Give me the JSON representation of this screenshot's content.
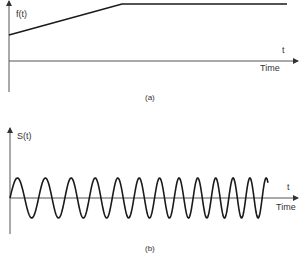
{
  "panel_a": {
    "ylabel": "f(t)",
    "xlabel_symbol": "t",
    "xlabel": "Time",
    "caption": "(a)",
    "polyline": [
      [
        9,
        35
      ],
      [
        122,
        4
      ],
      [
        287,
        4
      ]
    ]
  },
  "panel_b": {
    "ylabel": "S(t)",
    "xlabel_symbol": "t",
    "xlabel": "Time",
    "caption": "(b)",
    "signal": {
      "x_start": 10,
      "x_end": 268,
      "baseline_y": 198,
      "amplitude": 20,
      "start_period_px": 30,
      "end_period_px": 16
    }
  },
  "colors": {
    "line": "#1a1a1a",
    "axis": "#555555",
    "text": "#333333"
  },
  "chart_data": [
    {
      "type": "line",
      "title": "(a)",
      "xlabel": "Time",
      "ylabel": "f(t)",
      "description": "Linear ramp of instantaneous frequency followed by constant plateau",
      "x": [
        0,
        0.4,
        1.0
      ],
      "values": [
        0.55,
        1.0,
        1.0
      ],
      "grid": false
    },
    {
      "type": "line",
      "title": "(b)",
      "xlabel": "Time",
      "ylabel": "S(t)",
      "description": "Sinusoid with increasing frequency (chirp), ~13 cycles",
      "cycles": 13,
      "amplitude": 1,
      "grid": false
    }
  ]
}
